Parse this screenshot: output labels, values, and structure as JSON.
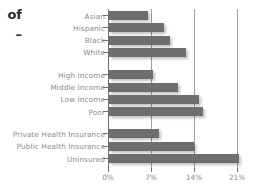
{
  "caption": {
    "line1": "of",
    "line2": "–"
  },
  "chart_data": {
    "type": "bar",
    "orientation": "horizontal",
    "title": "",
    "subtitle": "",
    "xlabel": "",
    "ylabel": "",
    "xlim": [
      0,
      21.8
    ],
    "xticks": [
      "0%",
      "7%",
      "14%",
      "21%"
    ],
    "xtick_values": [
      0,
      7,
      14,
      21
    ],
    "grid": true,
    "legend": false,
    "bar_color": "#6e6e6e",
    "gridline_color": "#9a9fb0",
    "label_color": "#8b8b8b",
    "groups": [
      {
        "name": "race",
        "categories": [
          "Asian",
          "Hispanic",
          "Black",
          "White"
        ],
        "values": [
          6.4,
          9.0,
          10.0,
          12.6
        ]
      },
      {
        "name": "income",
        "categories": [
          "High Income",
          "Middle Income",
          "Low Income",
          "Poor"
        ],
        "values": [
          7.1,
          11.2,
          14.6,
          15.3
        ]
      },
      {
        "name": "insurance",
        "categories": [
          "Private Health Insurance",
          "Public Health Insurance",
          "Uninsured"
        ],
        "values": [
          8.2,
          13.8,
          21.1
        ]
      }
    ],
    "categories": [
      "Asian",
      "Hispanic",
      "Black",
      "White",
      "High Income",
      "Middle Income",
      "Low Income",
      "Poor",
      "Private Health Insurance",
      "Public Health Insurance",
      "Uninsured"
    ],
    "values": [
      6.4,
      9.0,
      10.0,
      12.6,
      7.1,
      11.2,
      14.6,
      15.3,
      8.2,
      13.8,
      21.1
    ]
  }
}
